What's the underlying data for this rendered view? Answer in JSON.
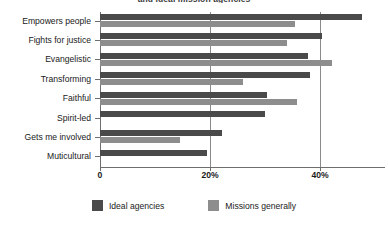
{
  "chart_data": {
    "type": "bar",
    "orientation": "horizontal",
    "title": "and ideal mission agencies",
    "xlabel": "",
    "ylabel": "",
    "xlim": [
      0,
      51.8
    ],
    "grid": true,
    "gridlines_at": [
      20,
      40
    ],
    "xticks": [
      0,
      20,
      40
    ],
    "xticklabels": [
      "0",
      "20%",
      "40%"
    ],
    "legend_position": "bottom",
    "categories": [
      "Empowers people",
      "Fights for justice",
      "Evangelistic",
      "Transforming",
      "Faithful",
      "Spirit-led",
      "Gets me involved",
      "Muticultural"
    ],
    "series": [
      {
        "name": "Ideal agencies",
        "color": "#4a4a4a",
        "values": [
          47.6,
          40.4,
          37.8,
          38.2,
          30.3,
          30.0,
          22.2,
          19.5
        ]
      },
      {
        "name": "Missions generally",
        "color": "#8d8d8d",
        "values": [
          35.5,
          34.0,
          42.1,
          26.0,
          35.8,
          0.0,
          14.5,
          0.0
        ]
      }
    ]
  },
  "legend": {
    "items": [
      {
        "label": "Ideal agencies",
        "swatch": "dark"
      },
      {
        "label": "Missions generally",
        "swatch": "light"
      }
    ]
  }
}
